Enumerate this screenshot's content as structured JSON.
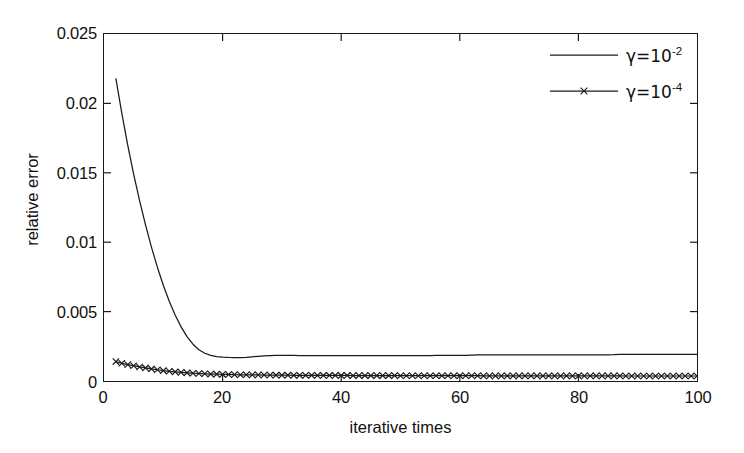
{
  "chart_data": {
    "type": "line",
    "title": "",
    "xlabel": "iterative times",
    "ylabel": "relative error",
    "xlim": [
      0,
      100
    ],
    "ylim": [
      0,
      0.025
    ],
    "xticks": [
      0,
      20,
      40,
      60,
      80,
      100
    ],
    "xticklabels": [
      "0",
      "20",
      "40",
      "60",
      "80",
      "100"
    ],
    "yticks": [
      0,
      0.005,
      0.01,
      0.015,
      0.02,
      0.025
    ],
    "yticklabels": [
      "0",
      "0.005",
      "0.01",
      "0.015",
      "0.02",
      "0.025"
    ],
    "grid": false,
    "legend_position": "upper right",
    "legend_box": false,
    "series": [
      {
        "name": "gamma = 10^-2",
        "legend_label_base": "γ=10",
        "legend_label_exponent": "-2",
        "marker": "none",
        "linestyle": "solid",
        "color": "#1a1a1a",
        "x": [
          2,
          3,
          4,
          5,
          6,
          7,
          8,
          9,
          10,
          11,
          12,
          13,
          14,
          15,
          16,
          17,
          18,
          19,
          20,
          21,
          22,
          23,
          24,
          25,
          26,
          27,
          28,
          29,
          30,
          31,
          32,
          33,
          34,
          35,
          36,
          37,
          38,
          39,
          40,
          41,
          42,
          43,
          44,
          45,
          46,
          47,
          48,
          49,
          50,
          51,
          52,
          53,
          54,
          55,
          56,
          57,
          58,
          59,
          60,
          61,
          62,
          63,
          64,
          65,
          66,
          67,
          68,
          69,
          70,
          71,
          72,
          73,
          74,
          75,
          76,
          77,
          78,
          79,
          80,
          81,
          82,
          83,
          84,
          85,
          86,
          87,
          88,
          89,
          90,
          91,
          92,
          93,
          94,
          95,
          96,
          97,
          98,
          99,
          100
        ],
        "y": [
          0.0218,
          0.0193,
          0.017,
          0.0149,
          0.013,
          0.01125,
          0.00965,
          0.0082,
          0.0069,
          0.00575,
          0.00475,
          0.0039,
          0.0032,
          0.00265,
          0.00225,
          0.002,
          0.00185,
          0.00176,
          0.00172,
          0.0017,
          0.00169,
          0.00169,
          0.0017,
          0.00174,
          0.00178,
          0.00181,
          0.00183,
          0.00184,
          0.00184,
          0.00184,
          0.00184,
          0.00183,
          0.00183,
          0.00183,
          0.00182,
          0.00182,
          0.00182,
          0.00182,
          0.00182,
          0.00182,
          0.00182,
          0.00182,
          0.00182,
          0.00182,
          0.00183,
          0.00183,
          0.00183,
          0.00183,
          0.00183,
          0.00183,
          0.00183,
          0.00183,
          0.00183,
          0.00183,
          0.00184,
          0.00184,
          0.00184,
          0.00184,
          0.00184,
          0.00184,
          0.00186,
          0.00188,
          0.00189,
          0.00189,
          0.00189,
          0.00189,
          0.00189,
          0.00189,
          0.00189,
          0.00189,
          0.00189,
          0.00189,
          0.00189,
          0.00189,
          0.00189,
          0.00189,
          0.00189,
          0.00189,
          0.00189,
          0.00189,
          0.00189,
          0.00189,
          0.00189,
          0.00189,
          0.0019,
          0.00192,
          0.00192,
          0.00192,
          0.00192,
          0.00192,
          0.00192,
          0.00192,
          0.00192,
          0.00192,
          0.00192,
          0.00192,
          0.00192,
          0.00192,
          0.00192
        ]
      },
      {
        "name": "gamma = 10^-4",
        "legend_label_base": "γ=10",
        "legend_label_exponent": "-4",
        "marker": "x",
        "linestyle": "solid",
        "color": "#1a1a1a",
        "x": [
          2,
          3,
          4,
          5,
          6,
          7,
          8,
          9,
          10,
          11,
          12,
          13,
          14,
          15,
          16,
          17,
          18,
          19,
          20,
          21,
          22,
          23,
          24,
          25,
          26,
          27,
          28,
          29,
          30,
          31,
          32,
          33,
          34,
          35,
          36,
          37,
          38,
          39,
          40,
          41,
          42,
          43,
          44,
          45,
          46,
          47,
          48,
          49,
          50,
          51,
          52,
          53,
          54,
          55,
          56,
          57,
          58,
          59,
          60,
          61,
          62,
          63,
          64,
          65,
          66,
          67,
          68,
          69,
          70,
          71,
          72,
          73,
          74,
          75,
          76,
          77,
          78,
          79,
          80,
          81,
          82,
          83,
          84,
          85,
          86,
          87,
          88,
          89,
          90,
          91,
          92,
          93,
          94,
          95,
          96,
          97,
          98,
          99,
          100
        ],
        "y": [
          0.0014,
          0.00128,
          0.00118,
          0.0011,
          0.00101,
          0.00094,
          0.00087,
          0.00081,
          0.00075,
          0.0007,
          0.00066,
          0.00062,
          0.00059,
          0.00056,
          0.00054,
          0.00052,
          0.0005,
          0.00049,
          0.00048,
          0.00047,
          0.00046,
          0.00045,
          0.00045,
          0.00044,
          0.00044,
          0.00043,
          0.00043,
          0.00042,
          0.00042,
          0.00042,
          0.00041,
          0.00041,
          0.00041,
          0.00041,
          0.0004,
          0.0004,
          0.0004,
          0.0004,
          0.0004,
          0.0004,
          0.00039,
          0.00039,
          0.00039,
          0.00039,
          0.00039,
          0.00039,
          0.00039,
          0.00039,
          0.00038,
          0.00038,
          0.00038,
          0.00038,
          0.00038,
          0.00038,
          0.00038,
          0.00038,
          0.00038,
          0.00038,
          0.00038,
          0.00038,
          0.00038,
          0.00038,
          0.00037,
          0.00037,
          0.00037,
          0.00037,
          0.00037,
          0.00037,
          0.00037,
          0.00037,
          0.00037,
          0.00037,
          0.00037,
          0.00037,
          0.00037,
          0.00037,
          0.00037,
          0.00037,
          0.00037,
          0.00037,
          0.00037,
          0.00037,
          0.00037,
          0.00037,
          0.00037,
          0.00037,
          0.00036,
          0.00036,
          0.00036,
          0.00036,
          0.00036,
          0.00036,
          0.00036,
          0.00036,
          0.00036,
          0.00036,
          0.00036,
          0.00036,
          0.00036
        ]
      }
    ]
  }
}
